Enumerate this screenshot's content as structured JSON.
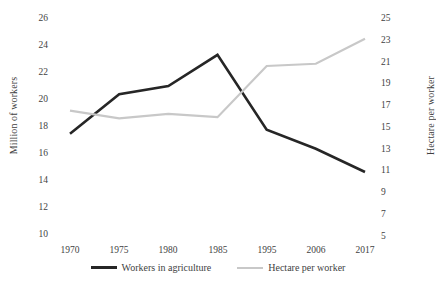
{
  "chart_data": {
    "type": "line",
    "title": "",
    "categories": [
      "1970",
      "1975",
      "1980",
      "1985",
      "1995",
      "2006",
      "2017"
    ],
    "series": [
      {
        "name": "Workers in agriculture",
        "axis": "left",
        "color": "#262626",
        "values": [
          17.5,
          20.4,
          21.0,
          23.3,
          17.8,
          16.4,
          14.7
        ]
      },
      {
        "name": "Hectare per worker",
        "axis": "right",
        "color": "#c8c8c8",
        "values": [
          16.5,
          15.8,
          16.2,
          15.9,
          20.6,
          20.8,
          23.1
        ]
      }
    ],
    "left_axis": {
      "label": "Million of workers",
      "ticks": [
        "26",
        "24",
        "22",
        "20",
        "18",
        "16",
        "14",
        "12",
        "10"
      ],
      "min": 10,
      "max": 26,
      "step": 2
    },
    "right_axis": {
      "label": "Hectare per worker",
      "ticks": [
        "25",
        "23",
        "21",
        "19",
        "17",
        "15",
        "13",
        "11",
        "9",
        "7",
        "5"
      ],
      "min": 5,
      "max": 25,
      "step": 2
    },
    "xlabel": "",
    "grid": false,
    "legend_position": "bottom",
    "legend": [
      {
        "label": "Workers in agriculture",
        "color": "#262626"
      },
      {
        "label": "Hectare per worker",
        "color": "#c8c8c8"
      }
    ]
  }
}
